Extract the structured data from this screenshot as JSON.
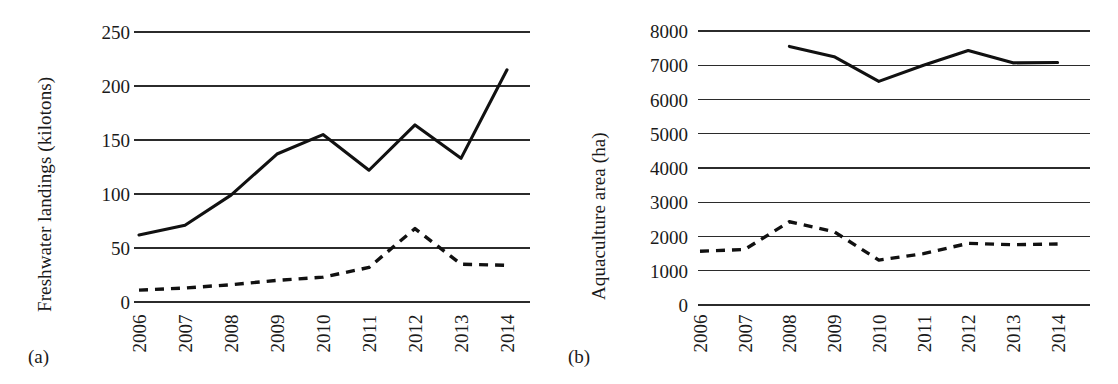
{
  "figure": {
    "panels": [
      {
        "key": "a",
        "label": "(a)"
      },
      {
        "key": "b",
        "label": "(b)"
      }
    ]
  },
  "chart_data": [
    {
      "panel": "(a)",
      "type": "line",
      "title": "",
      "xlabel": "",
      "ylabel": "Freshwater landings (kilotons)",
      "x": [
        2006,
        2007,
        2008,
        2009,
        2010,
        2011,
        2012,
        2013,
        2014
      ],
      "xticklabels": [
        "2006",
        "2007",
        "2008",
        "2009",
        "2010",
        "2011",
        "2012",
        "2013",
        "2014"
      ],
      "yticks": [
        0,
        50,
        100,
        150,
        200,
        250
      ],
      "yticklabels": [
        "0",
        "50",
        "100",
        "150",
        "200",
        "250"
      ],
      "ylim": [
        0,
        250
      ],
      "grid": "horizontal",
      "legend": "none",
      "series": [
        {
          "name": "capture-solid",
          "style": "solid",
          "color": "#111111",
          "values": [
            62,
            71,
            99,
            137,
            155,
            122,
            164,
            133,
            215
          ]
        },
        {
          "name": "aquaculture-dashed",
          "style": "dashed",
          "color": "#111111",
          "values": [
            11,
            13,
            16,
            20,
            23,
            32,
            68,
            35,
            34
          ]
        }
      ]
    },
    {
      "panel": "(b)",
      "type": "line",
      "title": "",
      "xlabel": "",
      "ylabel": "Aquaculture area (ha)",
      "x": [
        2006,
        2007,
        2008,
        2009,
        2010,
        2011,
        2012,
        2013,
        2014
      ],
      "xticklabels": [
        "2006",
        "2007",
        "2008",
        "2009",
        "2010",
        "2011",
        "2012",
        "2013",
        "2014"
      ],
      "yticks": [
        0,
        1000,
        2000,
        3000,
        4000,
        5000,
        6000,
        7000,
        8000
      ],
      "yticklabels": [
        "0",
        "1000",
        "2000",
        "3000",
        "4000",
        "5000",
        "6000",
        "7000",
        "8000"
      ],
      "ylim": [
        0,
        8000
      ],
      "grid": "horizontal",
      "legend": "none",
      "series": [
        {
          "name": "area-solid",
          "style": "solid",
          "color": "#111111",
          "values": [
            null,
            null,
            7550,
            7250,
            6530,
            7000,
            7430,
            7070,
            7080
          ]
        },
        {
          "name": "area-dashed",
          "style": "dashed",
          "color": "#111111",
          "values": [
            1570,
            1620,
            2430,
            2140,
            1310,
            1500,
            1800,
            1760,
            1780
          ]
        }
      ]
    }
  ]
}
